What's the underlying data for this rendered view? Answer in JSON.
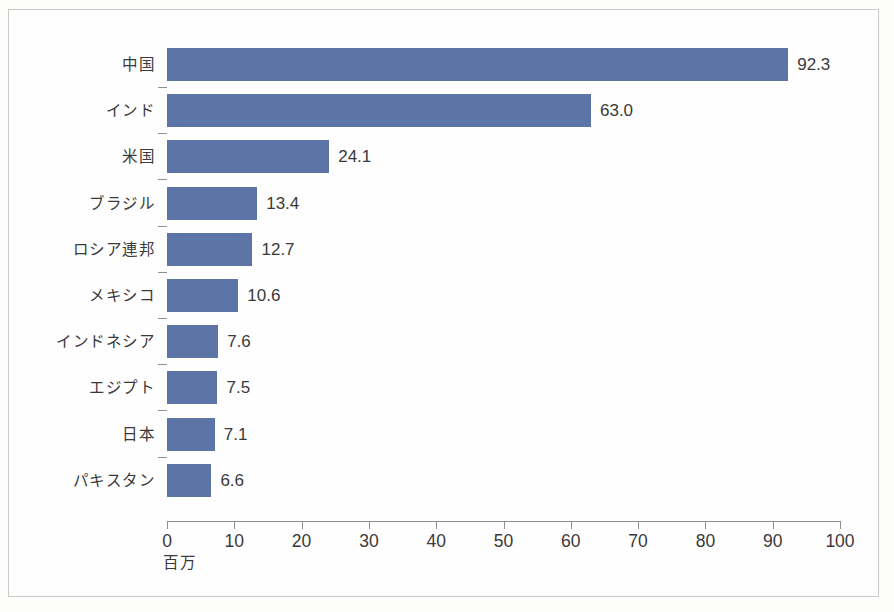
{
  "chart_data": {
    "type": "bar",
    "orientation": "horizontal",
    "title": "",
    "subtitle": "",
    "xlabel": "百万",
    "ylabel": "",
    "xlim": [
      0,
      100
    ],
    "xticks": [
      0,
      10,
      20,
      30,
      40,
      50,
      60,
      70,
      80,
      90,
      100
    ],
    "xtick_labels": [
      "0",
      "10",
      "20",
      "30",
      "40",
      "50",
      "60",
      "70",
      "80",
      "90",
      "100"
    ],
    "grid": false,
    "legend": null,
    "bar_color": "#5c74a6",
    "categories": [
      "中国",
      "インド",
      "米国",
      "ブラジル",
      "ロシア連邦",
      "メキシコ",
      "インドネシア",
      "エジプト",
      "日本",
      "パキスタン"
    ],
    "values": [
      92.3,
      63.0,
      24.1,
      13.4,
      12.7,
      10.6,
      7.6,
      7.5,
      7.1,
      6.6
    ],
    "value_labels": [
      "92.3",
      "63.0",
      "24.1",
      "13.4",
      "12.7",
      "10.6",
      "7.6",
      "7.5",
      "7.1",
      "6.6"
    ]
  },
  "axis": {
    "x_title": "百万"
  }
}
